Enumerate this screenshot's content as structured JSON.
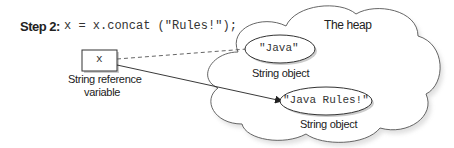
{
  "step": {
    "label": "Step 2:",
    "code": "x = x.concat (\"Rules!\");"
  },
  "reference": {
    "var_name": "x",
    "caption_line1": "String reference",
    "caption_line2": "variable"
  },
  "heap": {
    "title": "The heap",
    "objects": [
      {
        "value": "\"Java\"",
        "caption": "String object",
        "link": "dashed"
      },
      {
        "value": "\"Java Rules!\"",
        "caption": "String object",
        "link": "arrow"
      }
    ]
  },
  "colors": {
    "stroke": "#444444",
    "shadow": "#cccccc",
    "text": "#222222"
  }
}
